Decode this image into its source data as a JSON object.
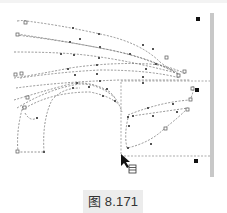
{
  "figure": {
    "caption": "图 8.171",
    "caption_bg": "#ececec",
    "line_color": "#777777",
    "node_color": "#555555",
    "handle_color": "#111111",
    "bar_color": "#c8c8c8"
  },
  "canvas": {
    "marquee": {
      "x": 121,
      "y": 81,
      "w": 91,
      "h": 75
    },
    "selection_handles": [
      {
        "x": 198,
        "y": 19
      },
      {
        "x": 197,
        "y": 90
      },
      {
        "x": 196,
        "y": 161
      }
    ],
    "side_bar": {
      "x": 210,
      "y": 13,
      "w": 4,
      "h": 164
    },
    "cursor": {
      "x": 121,
      "y": 155
    },
    "cursor_icon": "list-icon"
  }
}
